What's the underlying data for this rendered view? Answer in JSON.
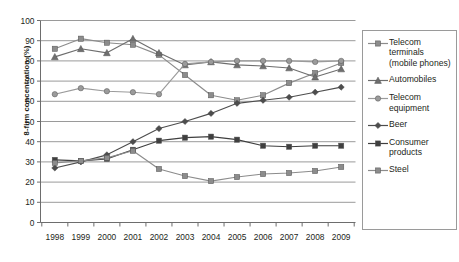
{
  "chart_data": {
    "type": "line",
    "title": "",
    "xlabel": "",
    "ylabel": "8-firm concentration (%)",
    "ylim": [
      0,
      100
    ],
    "ytick_step": 10,
    "yticks": [
      0,
      10,
      20,
      30,
      40,
      50,
      60,
      70,
      80,
      90,
      100
    ],
    "grid": "horizontal",
    "legend_position": "right",
    "categories": [
      1998,
      1999,
      2000,
      2001,
      2002,
      2003,
      2004,
      2005,
      2006,
      2007,
      2008,
      2009
    ],
    "xticks": [
      "1998",
      "1999",
      "2000",
      "2001",
      "2002",
      "2003",
      "2004",
      "2005",
      "2006",
      "2007",
      "2008",
      "2009"
    ],
    "series": [
      {
        "name": "Telecom terminals (mobile phones)",
        "marker": "square",
        "color": "#8c8c8c",
        "values": [
          86,
          91,
          89,
          88,
          83,
          73,
          63,
          60.5,
          63,
          69,
          74,
          79
        ]
      },
      {
        "name": "Automobiles",
        "marker": "triangle",
        "color": "#6e6e6e",
        "values": [
          82,
          86,
          84,
          91,
          84,
          78,
          79.5,
          78,
          77.5,
          76.5,
          72,
          76
        ]
      },
      {
        "name": "Telecom equipment",
        "marker": "circle",
        "color": "#9b9b9b",
        "values": [
          63.5,
          66.5,
          65,
          64.5,
          63.5,
          78.5,
          79.5,
          80,
          80,
          80,
          79.5,
          80
        ]
      },
      {
        "name": "Beer",
        "marker": "diamond",
        "color": "#4d4d4d",
        "values": [
          27,
          30,
          33.5,
          40,
          46.5,
          50,
          54,
          59,
          60.5,
          62,
          64.5,
          67
        ]
      },
      {
        "name": "Consumer products",
        "marker": "square-dark",
        "color": "#3f3f3f",
        "values": [
          31,
          30.5,
          31.5,
          36,
          40.5,
          42,
          42.5,
          41,
          38,
          37.5,
          38,
          38
        ]
      },
      {
        "name": "Steel",
        "marker": "square",
        "color": "#8c8c8c",
        "values": [
          29.5,
          30.5,
          32,
          35.5,
          26.5,
          23,
          20.5,
          22.5,
          24,
          24.5,
          25.5,
          27.5
        ]
      }
    ]
  },
  "legend": {
    "items": [
      {
        "label": "Telecom terminals (mobile phones)",
        "marker": "square",
        "color": "#8c8c8c"
      },
      {
        "label": "Automobiles",
        "marker": "triangle",
        "color": "#6e6e6e"
      },
      {
        "label": "Telecom equipment",
        "marker": "circle",
        "color": "#9b9b9b"
      },
      {
        "label": "Beer",
        "marker": "diamond",
        "color": "#4d4d4d"
      },
      {
        "label": "Consumer products",
        "marker": "square-dark",
        "color": "#3f3f3f"
      },
      {
        "label": "Steel",
        "marker": "square",
        "color": "#8c8c8c"
      }
    ]
  },
  "axis": {
    "y_title": "8-firm concentration (%)"
  }
}
